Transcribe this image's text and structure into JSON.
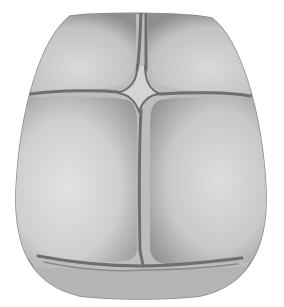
{
  "figure": {
    "colors": {
      "background": "#ffffff",
      "bone_light": "#dcdcdc",
      "bone_mid": "#b8b8b8",
      "bone_edge": "#8a8a8a",
      "suture": "#6e6e6e",
      "fontanelle": "#d2d2d2"
    }
  }
}
